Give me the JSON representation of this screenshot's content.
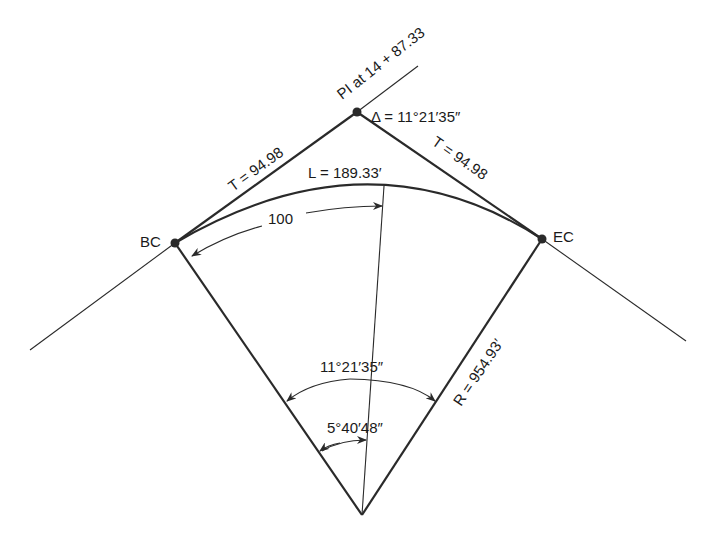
{
  "diagram": {
    "type": "horizontal-circular-curve",
    "colors": {
      "ink": "#2a2a2a",
      "background": "#ffffff"
    },
    "points": {
      "pi": {
        "label": "PI at 14 + 87.33"
      },
      "bc": {
        "label": "BC"
      },
      "ec": {
        "label": "EC"
      }
    },
    "labels": {
      "delta": "Δ = 11°21′35″",
      "tangent_left": "T = 94.98",
      "tangent_right": "T = 94.98",
      "arc_length": "L = 189.33′",
      "chord_arc": "100",
      "central_angle": "11°21′35″",
      "half_angle": "5°40′48″",
      "radius": "R = 954.93′"
    }
  }
}
